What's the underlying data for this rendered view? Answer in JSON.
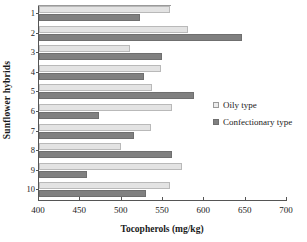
{
  "chart_data": {
    "type": "bar",
    "orientation": "horizontal",
    "title": "",
    "xlabel": "Tocopherols  (mg/kg)",
    "ylabel": "Sunflower hybrids",
    "categories": [
      "1",
      "2",
      "3",
      "4",
      "5",
      "6",
      "7",
      "8",
      "9",
      "10"
    ],
    "xlim": [
      400,
      700
    ],
    "xticks": [
      400,
      450,
      500,
      550,
      600,
      650,
      700
    ],
    "grid": false,
    "legend_position": "right",
    "series": [
      {
        "name": "Oily type",
        "color": "#e3e3e3",
        "values": [
          558,
          580,
          510,
          548,
          537,
          561,
          536,
          499,
          573,
          558
        ]
      },
      {
        "name": "Confectionary type",
        "color": "#808080",
        "values": [
          522,
          645,
          549,
          527,
          588,
          472,
          515,
          561,
          458,
          530
        ]
      }
    ]
  },
  "legend": {
    "items": [
      {
        "label": "Oily type",
        "swatch": "oily-swatch-icon"
      },
      {
        "label": "Confectionary type",
        "swatch": "confectionary-swatch-icon"
      }
    ]
  }
}
